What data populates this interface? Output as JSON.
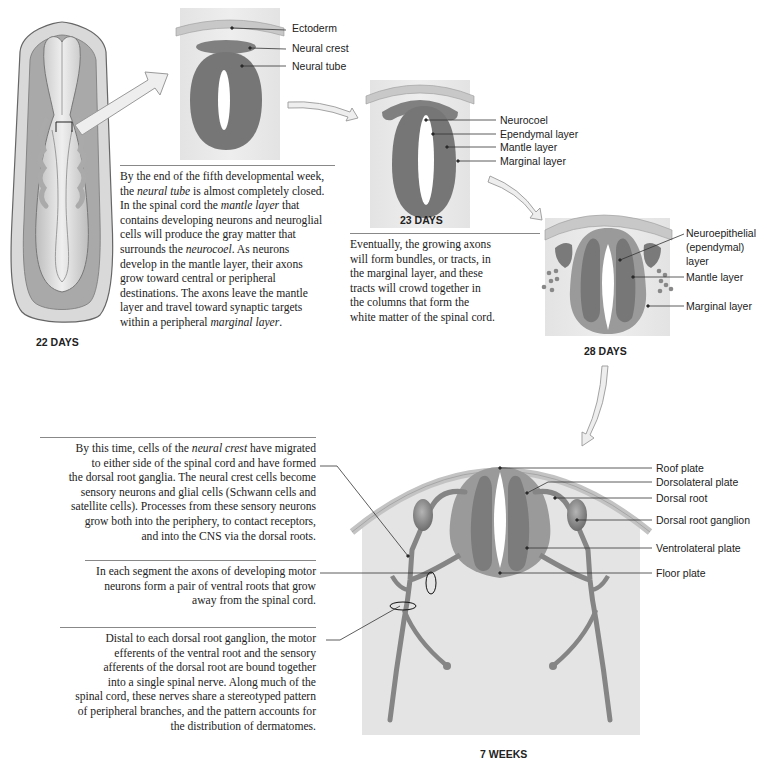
{
  "figure": {
    "stages": {
      "s22": "22 DAYS",
      "s23": "23 DAYS",
      "s28": "28 DAYS",
      "w7": "7 WEEKS"
    },
    "labels_22_to_23": {
      "ectoderm": "Ectoderm",
      "neural_crest": "Neural crest",
      "neural_tube": "Neural tube"
    },
    "labels_23": {
      "neurocoel": "Neurocoel",
      "ependymal": "Ependymal layer",
      "mantle": "Mantle layer",
      "marginal": "Marginal layer"
    },
    "labels_28": {
      "neuroepithelial_1": "Neuroepithelial",
      "neuroepithelial_2": "(ependymal)",
      "neuroepithelial_3": "layer",
      "mantle": "Mantle layer",
      "marginal": "Marginal layer"
    },
    "labels_7w": {
      "roof_plate": "Roof plate",
      "dorsolateral_plate": "Dorsolateral plate",
      "dorsal_root": "Dorsal root",
      "dorsal_root_ganglion": "Dorsal root ganglion",
      "ventrolateral_plate": "Ventrolateral plate",
      "floor_plate": "Floor plate"
    },
    "paragraphs": {
      "fifth_week": [
        "By the end of the fifth developmental week,",
        "the |neural tube| is almost completely closed.",
        "In the spinal cord the |mantle layer| that",
        "contains developing neurons and neuroglial",
        "cells will produce the gray matter that",
        "surrounds the |neurocoel|.  As neurons",
        "develop in the mantle layer, their axons",
        "grow toward central or peripheral",
        "destinations. The axons leave the mantle",
        "layer and travel toward synaptic targets",
        "within a peripheral |marginal layer|."
      ],
      "axons_tracts": [
        "Eventually, the growing axons",
        "will form bundles, or tracts, in",
        "the marginal layer, and these",
        "tracts will crowd together in",
        "the columns that form the",
        "white matter of the spinal cord."
      ],
      "neural_crest_migration": [
        "By this time, cells of the |neural crest| have migrated",
        "to either side of the spinal cord and have formed",
        "the dorsal root ganglia. The neural crest cells become",
        "sensory neurons and glial cells (Schwann cells and",
        "satellite cells). Processes from these sensory neurons",
        "grow both into the periphery, to contact receptors,",
        "and into the CNS via the dorsal roots."
      ],
      "ventral_roots": [
        "In each segment the axons of developing motor",
        "neurons form a pair of ventral roots that grow",
        "away from the spinal cord."
      ],
      "spinal_nerve": [
        "Distal to each dorsal root ganglion, the motor",
        "efferents of the ventral root and the sensory",
        "afferents of the dorsal root are bound together",
        "into a single spinal nerve. Along much of the",
        "spinal cord, these nerves share a stereotyped pattern",
        "of peripheral branches, and the pattern accounts for",
        "the distribution of dermatomes."
      ]
    },
    "colors": {
      "tissue_dark": "#777777",
      "tissue_mid": "#9a9a9a",
      "background_panel": "#e6e6e6",
      "ectoderm": "#c8c8c8",
      "arrow_fill": "#eeeeee"
    }
  }
}
